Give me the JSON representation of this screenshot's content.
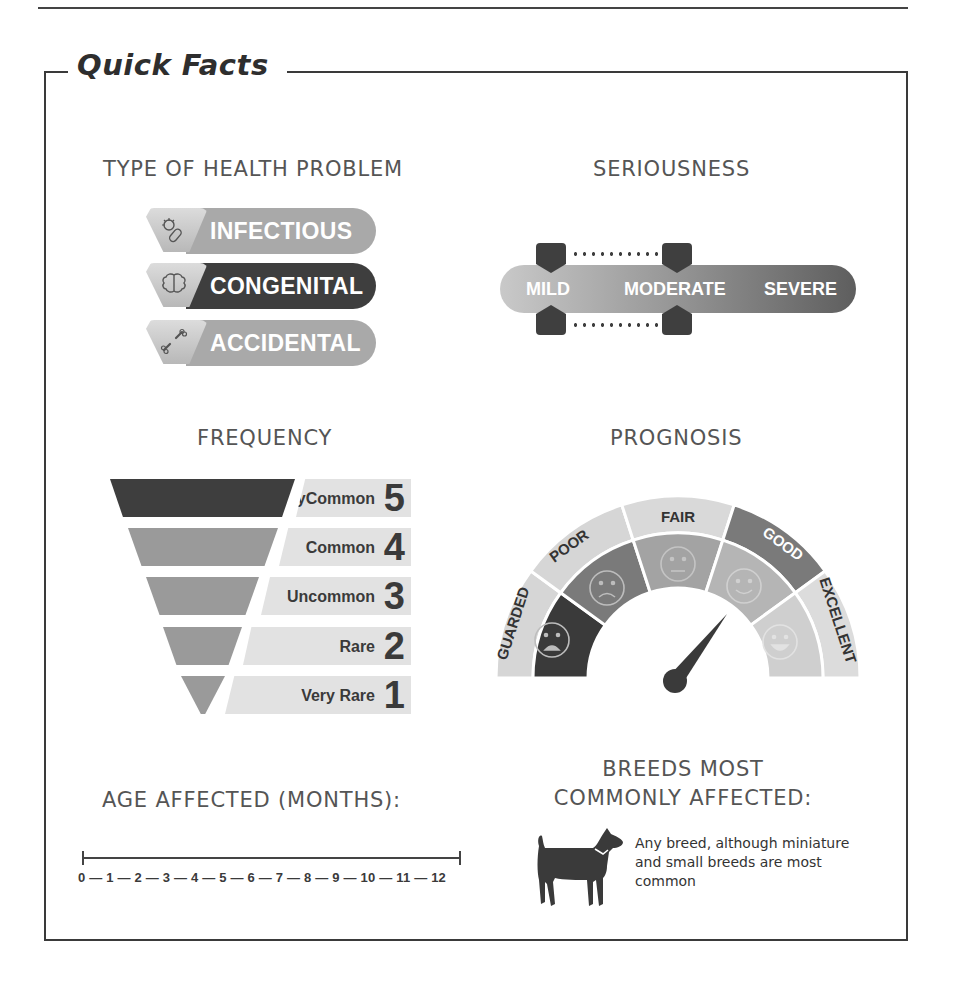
{
  "title": "Quick Facts",
  "type_of_health_problem": {
    "heading": "TYPE OF HEALTH PROBLEM",
    "items": [
      {
        "label": "INFECTIOUS",
        "icon": "microbe-icon",
        "selected": false,
        "color": "#a9a9a9"
      },
      {
        "label": "CONGENITAL",
        "icon": "brain-icon",
        "selected": true,
        "color": "#3e3e3e"
      },
      {
        "label": "ACCIDENTAL",
        "icon": "broken-bone-icon",
        "selected": false,
        "color": "#a9a9a9"
      }
    ]
  },
  "seriousness": {
    "heading": "SERIOUSNESS",
    "levels": [
      "MILD",
      "MODERATE",
      "SEVERE"
    ],
    "range_from": "MILD",
    "range_to": "MODERATE"
  },
  "frequency": {
    "heading": "FREQUENCY",
    "levels": [
      {
        "label_line1": "Very",
        "label_line2": "Common",
        "value": "5",
        "selected": true,
        "color": "#3e3e3e"
      },
      {
        "label_line1": "",
        "label_line2": "Common",
        "value": "4",
        "selected": false,
        "color": "#9a9a9a"
      },
      {
        "label_line1": "",
        "label_line2": "Uncommon",
        "value": "3",
        "selected": false,
        "color": "#9a9a9a"
      },
      {
        "label_line1": "",
        "label_line2": "Rare",
        "value": "2",
        "selected": false,
        "color": "#9a9a9a"
      },
      {
        "label_line1": "Very Rare",
        "label_line2": "",
        "value": "1",
        "selected": false,
        "color": "#9a9a9a"
      }
    ]
  },
  "prognosis": {
    "heading": "PROGNOSIS",
    "segments": [
      {
        "label": "GUARDED",
        "face": "very-sad-face-icon"
      },
      {
        "label": "POOR",
        "face": "sad-face-icon"
      },
      {
        "label": "FAIR",
        "face": "neutral-face-icon"
      },
      {
        "label": "GOOD",
        "face": "smile-face-icon"
      },
      {
        "label": "EXCELLENT",
        "face": "happy-face-icon"
      }
    ],
    "needle_points_to": "GOOD"
  },
  "age_affected": {
    "heading": "AGE AFFECTED (MONTHS):",
    "scale": "0 — 1 — 2 — 3 — 4 — 5 — 6 — 7 — 8 — 9 — 10 — 11 — 12",
    "range_start": "0",
    "range_end": "12"
  },
  "breeds": {
    "heading_line1": "BREEDS MOST",
    "heading_line2": "COMMONLY AFFECTED:",
    "text": "Any breed, although miniature and small breeds are most common",
    "icon": "dog-icon"
  }
}
